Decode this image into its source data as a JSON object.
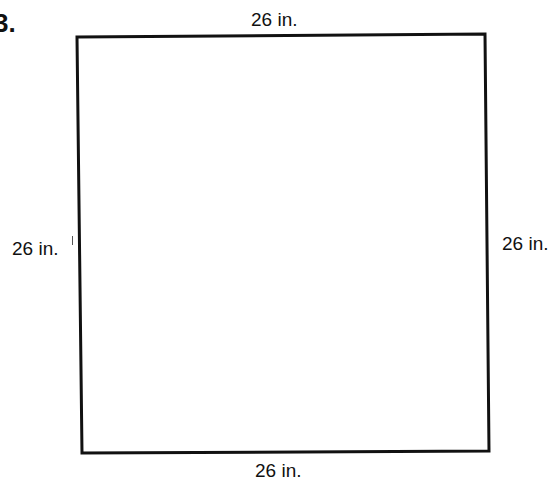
{
  "problem": {
    "number": "3."
  },
  "figure": {
    "shape": "square",
    "stroke_color": "#111111",
    "background": "#ffffff",
    "corners": {
      "top_left": [
        77,
        37
      ],
      "top_right": [
        485,
        34
      ],
      "bottom_right": [
        489,
        451
      ],
      "bottom_left": [
        82,
        453
      ]
    },
    "side_labels": {
      "top": "26 in.",
      "left": "26 in.",
      "right": "26 in.",
      "bottom": "26 in."
    }
  }
}
